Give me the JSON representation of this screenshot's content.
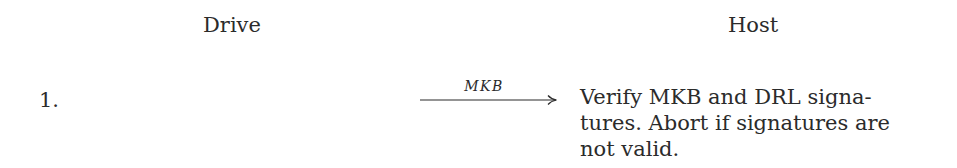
{
  "headers": {
    "drive": "Drive",
    "host": "Host"
  },
  "steps": [
    {
      "number": "1.",
      "message": {
        "label": "MKB",
        "direction": "drive-to-host"
      },
      "host_action_lines": [
        "Verify MKB and DRL signa-",
        "tures. Abort if signatures are",
        "not valid."
      ]
    }
  ]
}
